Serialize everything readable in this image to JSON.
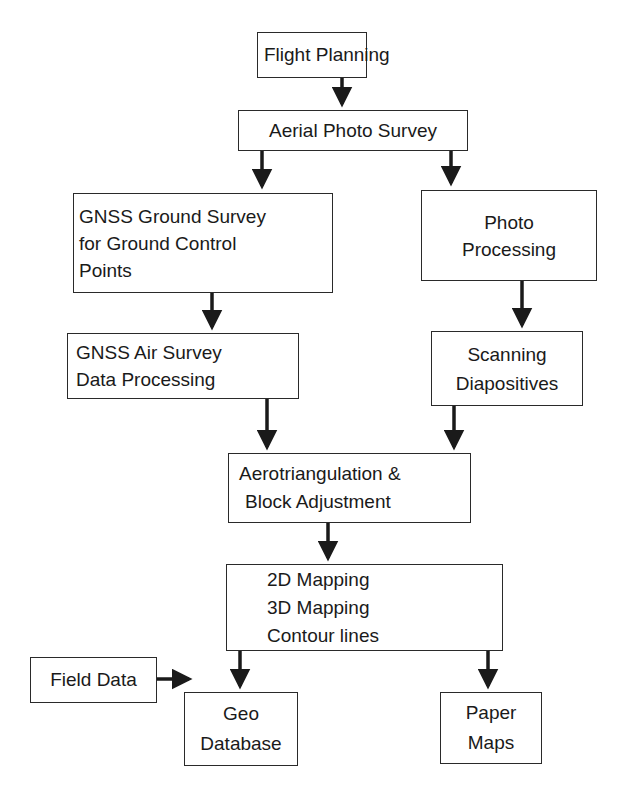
{
  "diagram": {
    "type": "flowchart",
    "nodes": {
      "flight_planning": {
        "lines": [
          "Flight Planning"
        ]
      },
      "aerial_photo_survey": {
        "lines": [
          "Aerial Photo Survey"
        ]
      },
      "gnss_ground_survey": {
        "lines": [
          "GNSS Ground Survey",
          "for Ground Control",
          "Points"
        ]
      },
      "photo_processing": {
        "lines": [
          "Photo",
          "Processing"
        ]
      },
      "gnss_air_survey": {
        "lines": [
          "GNSS Air Survey",
          "Data Processing"
        ]
      },
      "scanning_diapositives": {
        "lines": [
          "Scanning",
          "Diapositives"
        ]
      },
      "aerotriangulation": {
        "lines": [
          "Aerotriangulation &",
          "Block Adjustment"
        ]
      },
      "mapping": {
        "lines": [
          "2D Mapping",
          "3D Mapping",
          "Contour lines"
        ]
      },
      "field_data": {
        "lines": [
          "Field Data"
        ]
      },
      "geo_database": {
        "lines": [
          "Geo",
          "Database"
        ]
      },
      "paper_maps": {
        "lines": [
          "Paper",
          "Maps"
        ]
      }
    },
    "edges": [
      [
        "flight_planning",
        "aerial_photo_survey"
      ],
      [
        "aerial_photo_survey",
        "gnss_ground_survey"
      ],
      [
        "aerial_photo_survey",
        "photo_processing"
      ],
      [
        "gnss_ground_survey",
        "gnss_air_survey"
      ],
      [
        "photo_processing",
        "scanning_diapositives"
      ],
      [
        "gnss_air_survey",
        "aerotriangulation"
      ],
      [
        "scanning_diapositives",
        "aerotriangulation"
      ],
      [
        "aerotriangulation",
        "mapping"
      ],
      [
        "mapping",
        "geo_database"
      ],
      [
        "mapping",
        "paper_maps"
      ],
      [
        "field_data",
        "geo_database"
      ]
    ],
    "colors": {
      "line": "#1a1a1a",
      "background": "#ffffff"
    }
  }
}
